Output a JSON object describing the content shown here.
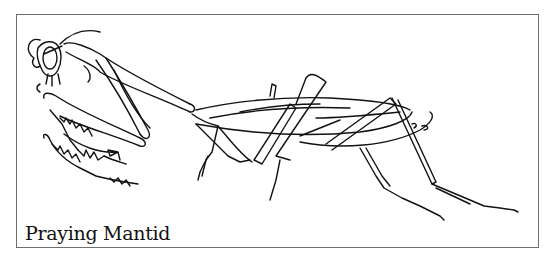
{
  "illustration": {
    "subject": "praying-mantis-line-drawing",
    "caption": "Praying Mantid",
    "colors": {
      "line": "#111111",
      "frame": "#6e6e6e",
      "background": "#ffffff"
    }
  }
}
